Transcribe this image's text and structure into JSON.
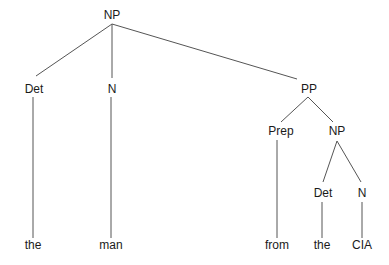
{
  "tree": {
    "nodes": [
      {
        "id": "np_root",
        "label": "NP"
      },
      {
        "id": "det1",
        "label": "Det"
      },
      {
        "id": "n1",
        "label": "N"
      },
      {
        "id": "pp",
        "label": "PP"
      },
      {
        "id": "prep",
        "label": "Prep"
      },
      {
        "id": "np2",
        "label": "NP"
      },
      {
        "id": "det2",
        "label": "Det"
      },
      {
        "id": "n2",
        "label": "N"
      },
      {
        "id": "leaf_the1",
        "label": "the"
      },
      {
        "id": "leaf_man",
        "label": "man"
      },
      {
        "id": "leaf_from",
        "label": "from"
      },
      {
        "id": "leaf_the2",
        "label": "the"
      },
      {
        "id": "leaf_cia",
        "label": "CIA"
      }
    ],
    "edges": [
      {
        "from": "np_root",
        "to": "det1"
      },
      {
        "from": "np_root",
        "to": "n1"
      },
      {
        "from": "np_root",
        "to": "pp"
      },
      {
        "from": "det1",
        "to": "leaf_the1"
      },
      {
        "from": "n1",
        "to": "leaf_man"
      },
      {
        "from": "pp",
        "to": "prep"
      },
      {
        "from": "pp",
        "to": "np2"
      },
      {
        "from": "prep",
        "to": "leaf_from"
      },
      {
        "from": "np2",
        "to": "det2"
      },
      {
        "from": "np2",
        "to": "n2"
      },
      {
        "from": "det2",
        "to": "leaf_the2"
      },
      {
        "from": "n2",
        "to": "leaf_cia"
      }
    ]
  }
}
